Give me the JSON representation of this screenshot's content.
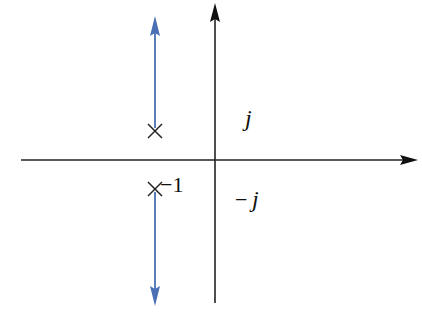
{
  "diagram": {
    "type": "complex-plane root locus sketch",
    "axes": {
      "real_axis": "horizontal",
      "imaginary_axis": "vertical",
      "color": "#111111"
    },
    "poles": [
      {
        "name": "upper-pole",
        "marker": "×",
        "label": ""
      },
      {
        "name": "lower-pole",
        "marker": "×",
        "label": "−1"
      }
    ],
    "loci": {
      "color": "#4a6fb5",
      "branches": [
        {
          "name": "upper-branch",
          "direction": "up"
        },
        {
          "name": "lower-branch",
          "direction": "down"
        }
      ]
    },
    "labels": {
      "plus_j": "j",
      "minus_sign": "−",
      "minus_j": "j",
      "pole_label": "−1"
    }
  }
}
